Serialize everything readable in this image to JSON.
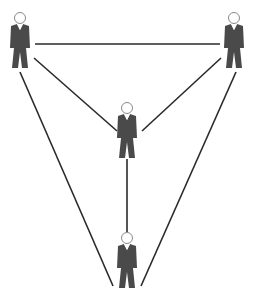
{
  "diagram": {
    "type": "network",
    "line_color": "#2a2a2a",
    "figure_color": "#4a4a4a",
    "head_stroke": "#888888",
    "nodes": [
      {
        "id": "person-top-left",
        "icon": "person-icon",
        "x": 20,
        "y": 18
      },
      {
        "id": "person-top-right",
        "icon": "person-icon",
        "x": 234,
        "y": 18
      },
      {
        "id": "person-center",
        "icon": "person-icon",
        "x": 127,
        "y": 108
      },
      {
        "id": "person-bottom",
        "icon": "person-icon",
        "x": 127,
        "y": 238
      }
    ],
    "edges": [
      {
        "from": "person-top-left",
        "to": "person-top-right"
      },
      {
        "from": "person-top-left",
        "to": "person-center"
      },
      {
        "from": "person-top-right",
        "to": "person-center"
      },
      {
        "from": "person-center",
        "to": "person-bottom"
      },
      {
        "from": "person-top-left",
        "to": "person-bottom"
      },
      {
        "from": "person-top-right",
        "to": "person-bottom"
      }
    ]
  }
}
